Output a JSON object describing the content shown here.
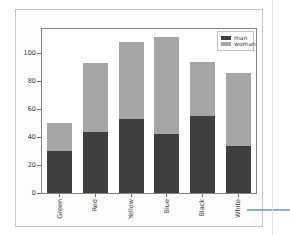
{
  "chart_data": {
    "type": "bar",
    "stacked": true,
    "title": "",
    "xlabel": "",
    "ylabel": "",
    "categories": [
      "Green",
      "Red",
      "Yellow",
      "Blue",
      "Black",
      "White"
    ],
    "series": [
      {
        "name": "man",
        "color": "#3f3f3f",
        "values": [
          30,
          44,
          53,
          42,
          55,
          34
        ]
      },
      {
        "name": "woman",
        "color": "#a6a6a6",
        "values": [
          20,
          49,
          55,
          70,
          39,
          52
        ]
      }
    ],
    "stacked_totals": [
      50,
      93,
      108,
      112,
      94,
      86
    ],
    "yticks": [
      0,
      20,
      40,
      60,
      80,
      100
    ],
    "ylim": [
      0,
      117.6
    ],
    "grid": false,
    "legend_position": "upper right",
    "x_tick_rotation": 90
  },
  "annotation": {
    "callout_color": "#8ab0c8"
  }
}
